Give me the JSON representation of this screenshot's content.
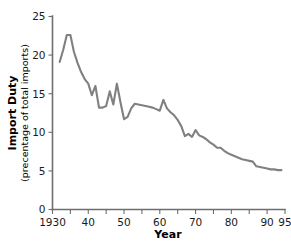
{
  "chart_data": {
    "type": "line",
    "title": "",
    "xlabel": "Year",
    "ylabel": "Import Duty",
    "ylabel_sub": "(precentage of total imports)",
    "xlim": [
      1930,
      1995
    ],
    "ylim": [
      0,
      25
    ],
    "grid": false,
    "legend": "none",
    "line_color": "#808080",
    "axis_color": "#6e6e6e",
    "background_color": "#ffffff",
    "y_ticks": [
      0,
      5,
      10,
      15,
      20,
      25
    ],
    "y_tick_labels": [
      "0",
      "5",
      "10",
      "15",
      "20",
      "25"
    ],
    "x_ticks": [
      1930,
      1935,
      1940,
      1945,
      1950,
      1955,
      1960,
      1965,
      1970,
      1975,
      1980,
      1985,
      1990,
      1995
    ],
    "x_tick_labels": [
      "1930",
      "",
      "40",
      "",
      "50",
      "",
      "60",
      "",
      "70",
      "",
      "80",
      "",
      "90",
      "95"
    ],
    "x_major_labels": [
      {
        "value": 1930,
        "label": "1930"
      },
      {
        "value": 1940,
        "label": "40"
      },
      {
        "value": 1950,
        "label": "50"
      },
      {
        "value": 1960,
        "label": "60"
      },
      {
        "value": 1970,
        "label": "70"
      },
      {
        "value": 1980,
        "label": "80"
      },
      {
        "value": 1990,
        "label": "90"
      },
      {
        "value": 1995,
        "label": "95"
      }
    ],
    "series": [
      {
        "name": "Import Duty",
        "x": [
          1932,
          1933,
          1934,
          1935,
          1936,
          1937,
          1938,
          1939,
          1940,
          1941,
          1942,
          1943,
          1944,
          1945,
          1946,
          1947,
          1948,
          1949,
          1950,
          1951,
          1952,
          1953,
          1954,
          1955,
          1956,
          1957,
          1958,
          1959,
          1960,
          1961,
          1962,
          1963,
          1964,
          1965,
          1966,
          1967,
          1968,
          1969,
          1970,
          1971,
          1972,
          1973,
          1974,
          1975,
          1976,
          1977,
          1978,
          1979,
          1980,
          1981,
          1982,
          1983,
          1984,
          1985,
          1986,
          1987,
          1988,
          1989,
          1990,
          1991,
          1992,
          1993,
          1994
        ],
        "values": [
          19.1,
          20.7,
          22.6,
          22.6,
          20.4,
          19.0,
          17.8,
          16.9,
          16.3,
          14.8,
          16.0,
          13.2,
          13.2,
          13.4,
          15.3,
          13.6,
          16.3,
          13.9,
          11.7,
          12.0,
          13.1,
          13.7,
          13.6,
          13.5,
          13.4,
          13.3,
          13.2,
          13.0,
          12.8,
          14.2,
          13.1,
          12.6,
          12.2,
          11.6,
          10.8,
          9.5,
          9.8,
          9.4,
          10.3,
          9.6,
          9.4,
          9.1,
          8.7,
          8.4,
          8.0,
          8.0,
          7.6,
          7.3,
          7.1,
          6.9,
          6.7,
          6.5,
          6.4,
          6.3,
          6.2,
          5.6,
          5.5,
          5.4,
          5.3,
          5.2,
          5.2,
          5.1,
          5.1
        ]
      }
    ]
  }
}
